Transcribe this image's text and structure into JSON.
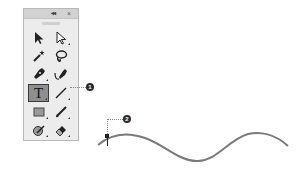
{
  "panel": {
    "title_buttons": {
      "collapse_label": "◂◂",
      "close_label": "×"
    },
    "tools": [
      {
        "name": "selection-tool",
        "icon": "arrow-solid-icon",
        "active": false,
        "has_subtools": false
      },
      {
        "name": "direct-selection-tool",
        "icon": "arrow-hollow-icon",
        "active": false,
        "has_subtools": true
      },
      {
        "name": "magic-wand-tool",
        "icon": "magic-wand-icon",
        "active": false,
        "has_subtools": false
      },
      {
        "name": "lasso-tool",
        "icon": "lasso-icon",
        "active": false,
        "has_subtools": false
      },
      {
        "name": "pen-tool",
        "icon": "pen-icon",
        "active": false,
        "has_subtools": true
      },
      {
        "name": "curvature-tool",
        "icon": "curvature-pen-icon",
        "active": false,
        "has_subtools": false
      },
      {
        "name": "type-tool",
        "icon": "type-icon",
        "label": "T",
        "active": true,
        "has_subtools": true
      },
      {
        "name": "line-segment-tool",
        "icon": "line-icon",
        "active": false,
        "has_subtools": true
      },
      {
        "name": "rectangle-tool",
        "icon": "rectangle-icon",
        "active": false,
        "has_subtools": true
      },
      {
        "name": "paintbrush-tool",
        "icon": "paintbrush-icon",
        "active": false,
        "has_subtools": true
      },
      {
        "name": "shaper-tool",
        "icon": "shaper-icon",
        "active": false,
        "has_subtools": true
      },
      {
        "name": "eraser-tool",
        "icon": "eraser-icon",
        "active": false,
        "has_subtools": true
      }
    ]
  },
  "callouts": [
    {
      "number": "1",
      "target": "type-tool"
    },
    {
      "number": "2",
      "target": "path-anchor-point"
    }
  ],
  "colors": {
    "panel_bg": "#ececec",
    "titlebar_bg": "#d2d2d2",
    "active_tool_bg": "#8f8f8f",
    "icon_color": "#2a2a2a",
    "curve_color": "#7a7a7a"
  }
}
